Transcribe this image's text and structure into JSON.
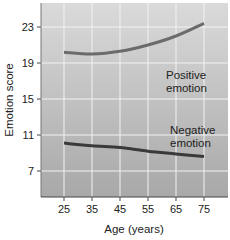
{
  "chart_data": {
    "type": "line",
    "title": "",
    "xlabel": "Age (years)",
    "ylabel": "Emotion score",
    "x": [
      25,
      35,
      45,
      55,
      65,
      75
    ],
    "xticks": [
      "25",
      "35",
      "45",
      "55",
      "65",
      "75"
    ],
    "yticks": [
      "7",
      "11",
      "15",
      "19",
      "23"
    ],
    "xlim": [
      17,
      83
    ],
    "ylim": [
      4,
      25.5
    ],
    "grid": true,
    "legend": "none (inline annotations)",
    "series": [
      {
        "name": "Positive emotion",
        "label_lines": [
          "Positive",
          "emotion"
        ],
        "values": [
          20.2,
          20.0,
          20.3,
          21.0,
          22.0,
          23.4
        ],
        "color": "#6b6b6b"
      },
      {
        "name": "Negative emotion",
        "label_lines": [
          "Negative",
          "emotion"
        ],
        "values": [
          10.1,
          9.8,
          9.6,
          9.2,
          8.9,
          8.6
        ],
        "color": "#3a3a3a"
      }
    ]
  },
  "colors": {
    "plot_bg_top": "#d9d9d9",
    "plot_bg_bottom": "#a9a9a9",
    "grid": "#f2f2f2",
    "axis": "#444444"
  }
}
